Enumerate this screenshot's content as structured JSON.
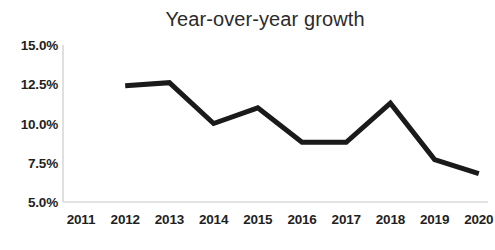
{
  "chart_data": {
    "type": "line",
    "title": "Year-over-year growth",
    "xlabel": "",
    "ylabel": "",
    "x": [
      2011,
      2012,
      2013,
      2014,
      2015,
      2016,
      2017,
      2018,
      2019,
      2020
    ],
    "categories": [
      "2011",
      "2012",
      "2013",
      "2014",
      "2015",
      "2016",
      "2017",
      "2018",
      "2019",
      "2020"
    ],
    "series": [
      {
        "name": "Year-over-year growth",
        "values": [
          null,
          12.4,
          12.6,
          10.0,
          11.0,
          8.8,
          8.8,
          11.3,
          7.7,
          6.8
        ],
        "color": "#1a1a1a"
      }
    ],
    "ylim": [
      5.0,
      15.0
    ],
    "yticks": [
      5.0,
      7.5,
      10.0,
      12.5,
      15.0
    ],
    "ytick_labels": [
      "5.0%",
      "7.5%",
      "10.0%",
      "12.5%",
      "15.0%"
    ],
    "xtick_labels": [
      "2011",
      "2012",
      "2013",
      "2014",
      "2015",
      "2016",
      "2017",
      "2018",
      "2019",
      "2020"
    ],
    "grid": false,
    "legend": false,
    "legend_position": "none",
    "axis_color": "#d8d8d8",
    "line_width": 5
  }
}
